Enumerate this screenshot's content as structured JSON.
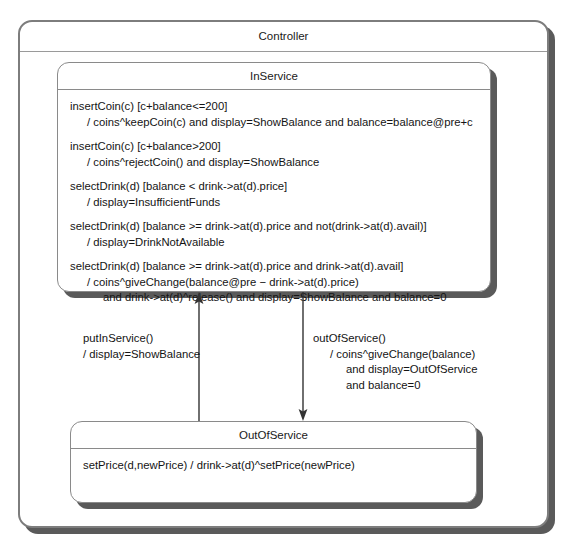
{
  "diagram": {
    "type": "uml-state-machine",
    "outer_state": {
      "name": "Controller"
    },
    "states": [
      {
        "id": "inservice",
        "name": "InService",
        "transitions": [
          {
            "lines": [
              {
                "text": "insertCoin(c) [c+balance<=200]",
                "indent": 0
              },
              {
                "text": "/ coins^keepCoin(c) and display=ShowBalance and balance=balance@pre+c",
                "indent": 1
              }
            ]
          },
          {
            "lines": [
              {
                "text": "insertCoin(c) [c+balance>200]",
                "indent": 0
              },
              {
                "text": "/ coins^rejectCoin() and display=ShowBalance",
                "indent": 1
              }
            ]
          },
          {
            "lines": [
              {
                "text": "selectDrink(d) [balance < drink->at(d).price]",
                "indent": 0
              },
              {
                "text": "/ display=InsufficientFunds",
                "indent": 1
              }
            ]
          },
          {
            "lines": [
              {
                "text": "selectDrink(d) [balance >= drink->at(d).price and not(drink->at(d).avail)]",
                "indent": 0
              },
              {
                "text": "/ display=DrinkNotAvailable",
                "indent": 1
              }
            ]
          },
          {
            "lines": [
              {
                "text": "selectDrink(d) [balance >= drink->at(d).price and drink->at(d).avail]",
                "indent": 0
              },
              {
                "text": "/ coins^giveChange(balance@pre − drink->at(d).price)",
                "indent": 1
              },
              {
                "text": "and drink->at(d)^release() and display=ShowBalance and balance=0",
                "indent": 2
              }
            ]
          }
        ]
      },
      {
        "id": "outofservice",
        "name": "OutOfService",
        "transitions": [
          {
            "lines": [
              {
                "text": "setPrice(d,newPrice) / drink->at(d)^setPrice(newPrice)",
                "indent": 0
              }
            ]
          }
        ]
      }
    ],
    "arrows": [
      {
        "id": "put-in-service",
        "from": "OutOfService",
        "to": "InService",
        "direction": "up",
        "lines": [
          {
            "text": "putInService()",
            "indent": 0
          },
          {
            "text": "/ display=ShowBalance",
            "indent": 0
          }
        ]
      },
      {
        "id": "out-of-service",
        "from": "InService",
        "to": "OutOfService",
        "direction": "down",
        "lines": [
          {
            "text": "outOfService()",
            "indent": 0
          },
          {
            "text": "/ coins^giveChange(balance)",
            "indent": 1
          },
          {
            "text": "and display=OutOfService",
            "indent": 2
          },
          {
            "text": "and balance=0",
            "indent": 2
          }
        ]
      }
    ],
    "colors": {
      "border": "#8a8a8a",
      "outer_border": "#7d7d7d",
      "shadow": "#5a5a5a",
      "text": "#1a1a1a",
      "background": "#ffffff",
      "arrow": "#333333"
    }
  }
}
